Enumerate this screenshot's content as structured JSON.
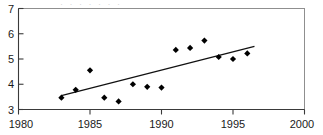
{
  "chart_data": {
    "type": "scatter",
    "title": "",
    "xlabel": "",
    "ylabel": "",
    "xlim": [
      1980,
      2000
    ],
    "ylim": [
      3,
      7
    ],
    "xticks": [
      1980,
      1985,
      1990,
      1995,
      2000
    ],
    "yticks": [
      3,
      4,
      5,
      6,
      7
    ],
    "grid": false,
    "legend": null,
    "marker_style": "filled-diamond",
    "marker_color": "#000000",
    "series": [
      {
        "name": "observations",
        "x": [
          1983,
          1984,
          1985,
          1986,
          1987,
          1988,
          1989,
          1990,
          1991,
          1992,
          1993,
          1994,
          1995,
          1996
        ],
        "values": [
          3.47,
          3.78,
          4.55,
          3.47,
          3.32,
          4.0,
          3.9,
          3.87,
          5.36,
          5.44,
          5.73,
          5.08,
          5.0,
          5.22
        ]
      },
      {
        "name": "linear-trend",
        "type": "line",
        "x": [
          1983.0,
          1996.5
        ],
        "values": [
          3.55,
          5.5
        ]
      }
    ]
  },
  "axes": {
    "y_tick_labels": [
      "7",
      "6",
      "5",
      "4",
      "3"
    ],
    "x_tick_labels": [
      "1980",
      "1985",
      "1990",
      "1995",
      "2000"
    ]
  },
  "title_remnant": {
    "text": "· ·  ·   ·  · ·   ·"
  }
}
